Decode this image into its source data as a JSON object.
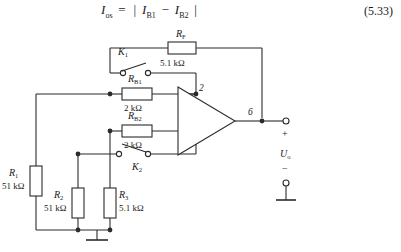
{
  "equation": {
    "lhs_var": "I",
    "lhs_sub": "os",
    "equals": "=",
    "bar_open": "|",
    "term1_var": "I",
    "term1_sub": "B1",
    "minus": "−",
    "term2_var": "I",
    "term2_sub": "B2",
    "bar_close": "|",
    "number": "(5.33)"
  },
  "circuit": {
    "type": "op-amp-input-offset-current-test",
    "components": {
      "RF": {
        "name": "R",
        "sub": "F",
        "value": "5.1 kΩ"
      },
      "RB1": {
        "name": "R",
        "sub": "B1",
        "value": "2 kΩ"
      },
      "RB2": {
        "name": "R",
        "sub": "B2",
        "value": "2 kΩ"
      },
      "R1": {
        "name": "R",
        "sub": "1",
        "value": "51 kΩ"
      },
      "R2": {
        "name": "R",
        "sub": "2",
        "value": "51 kΩ"
      },
      "R3": {
        "name": "R",
        "sub": "3",
        "value": "5.1 kΩ"
      }
    },
    "switches": {
      "K1": {
        "name": "K",
        "sub": "1"
      },
      "K2": {
        "name": "K",
        "sub": "2"
      }
    },
    "opamp": {
      "pin_inverting": "2",
      "sign_inverting": "−",
      "pin_noninverting": "3",
      "sign_noninverting": "+",
      "pin_output": "6"
    },
    "output": {
      "plus": "+",
      "label_name": "U",
      "label_sub": "o",
      "minus": "−"
    }
  }
}
